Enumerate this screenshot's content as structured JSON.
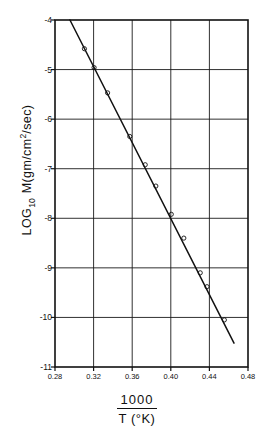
{
  "chart_data": {
    "type": "line",
    "title": "",
    "xlabel": "1000 / T (°K)",
    "xlabel_numerator": "1000",
    "xlabel_denominator": "T (°K)",
    "ylabel": "LOG10 M(gm/cm2/sec)",
    "ylabel_prefix": "LOG",
    "ylabel_subscript": "10",
    "ylabel_rest_a": "M(gm/cm",
    "ylabel_superscript": "2",
    "ylabel_rest_b": "/sec)",
    "xlim": [
      0.28,
      0.48
    ],
    "ylim": [
      -11,
      -4
    ],
    "xticks": [
      0.28,
      0.32,
      0.36,
      0.4,
      0.44,
      0.48
    ],
    "xtick_labels": [
      "0.28",
      "0.32",
      "0.36",
      "0.40",
      "0.44",
      "0.48"
    ],
    "yticks": [
      -4,
      -5,
      -6,
      -7,
      -8,
      -9,
      -10,
      -11
    ],
    "ytick_labels": [
      "-4",
      "-5",
      "-6",
      "-7",
      "-8",
      "-9",
      "-10",
      "-11"
    ],
    "grid": true,
    "grid_color": "#1a1a1a",
    "legend": null,
    "series": [
      {
        "name": "fitted line",
        "type": "line",
        "color": "#111111",
        "x": [
          0.2955,
          0.4655
        ],
        "values": [
          -4.0,
          -10.52
        ]
      },
      {
        "name": "measurements",
        "type": "scatter",
        "marker": "open-circle",
        "color": "#111111",
        "x": [
          0.3105,
          0.3205,
          0.3345,
          0.3575,
          0.3735,
          0.3845,
          0.4005,
          0.4135,
          0.4305,
          0.4375,
          0.4555
        ],
        "values": [
          -4.58,
          -4.96,
          -5.47,
          -6.35,
          -6.92,
          -7.35,
          -7.92,
          -8.4,
          -9.1,
          -9.38,
          -10.05
        ]
      }
    ]
  },
  "figure": {
    "background_color": "#ffffff",
    "axis_color": "#111111",
    "plot_area": {
      "left": 55,
      "top": 20,
      "right": 248,
      "bottom": 367
    }
  }
}
